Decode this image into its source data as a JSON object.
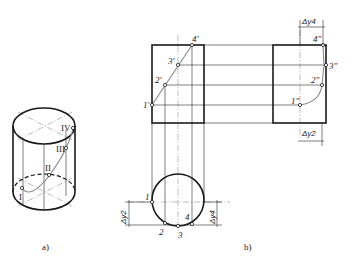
{
  "figure": {
    "captions": {
      "a": "a)",
      "b": "b)"
    }
  },
  "isometric": {
    "points": [
      "I",
      "II",
      "III",
      "IV"
    ]
  },
  "front_view": {
    "points": [
      "1'",
      "2'",
      "3'",
      "4'"
    ]
  },
  "side_view": {
    "points": [
      "1\"",
      "2\"",
      "3\"",
      "4\""
    ],
    "dims": {
      "top": "Δy4",
      "bottom": "Δy2"
    }
  },
  "top_view": {
    "points": [
      "1",
      "2",
      "3",
      "4"
    ],
    "dims": {
      "left": "Δy2",
      "right": "Δy4"
    }
  },
  "colors": {
    "line": "#1a1a1a",
    "curve": "#888888",
    "background": "#ffffff"
  }
}
